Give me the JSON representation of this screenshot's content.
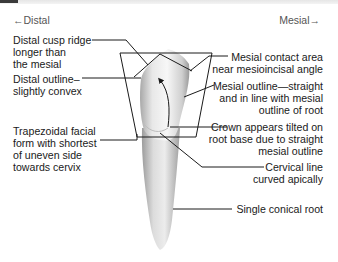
{
  "directions": {
    "left": "←Distal",
    "right": "Mesial→"
  },
  "labels_left": [
    {
      "id": "distal-cusp-ridge",
      "lines": [
        "Distal cusp ridge",
        "longer than",
        "the mesial"
      ]
    },
    {
      "id": "distal-outline",
      "lines": [
        "Distal outline–",
        "slightly convex"
      ]
    },
    {
      "id": "trapezoidal-form",
      "lines": [
        "Trapezoidal facial",
        "form with shortest",
        "of uneven side",
        "towards cervix"
      ]
    }
  ],
  "labels_right": [
    {
      "id": "mesial-contact-area",
      "lines": [
        "Mesial contact area",
        "near mesioincisal angle"
      ]
    },
    {
      "id": "mesial-outline",
      "lines": [
        "Mesial outline—straight",
        "and in line with mesial",
        "outline of root"
      ]
    },
    {
      "id": "crown-tilted",
      "lines": [
        "Crown appears tilted on",
        "root base due to straight",
        "mesial outline"
      ]
    },
    {
      "id": "cervical-line",
      "lines": [
        "Cervical line",
        "curved apically"
      ]
    },
    {
      "id": "conical-root",
      "lines": [
        "Single conical root"
      ]
    }
  ],
  "colors": {
    "line": "#1a1a1a",
    "tooth_light": "#f2f2f2",
    "tooth_mid": "#cfcfcf",
    "tooth_dark": "#9a9a9a",
    "text": "#1a1a1a",
    "direction_text": "#555555"
  }
}
